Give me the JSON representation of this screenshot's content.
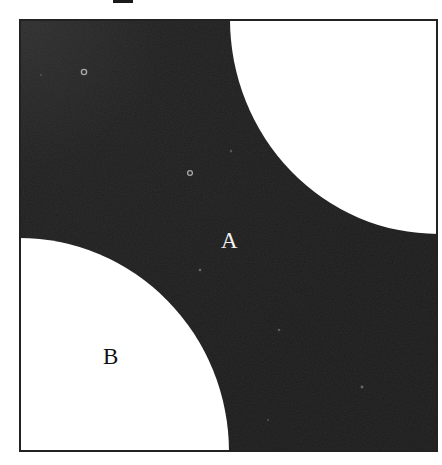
{
  "figure": {
    "heading_fragment": "p",
    "regions": [
      {
        "id": "A",
        "label": "A",
        "fill": "#1e1e1e",
        "text_color": "#f2f2f2"
      },
      {
        "id": "B",
        "label": "B",
        "fill": "#ffffff",
        "text_color": "#111111"
      }
    ],
    "colors": {
      "dark_region": "#1e1e1e",
      "dark_region_highlight": "#2c2c2c",
      "light_region": "#ffffff",
      "border": "#222222",
      "speck": "#9a9a9a"
    }
  }
}
